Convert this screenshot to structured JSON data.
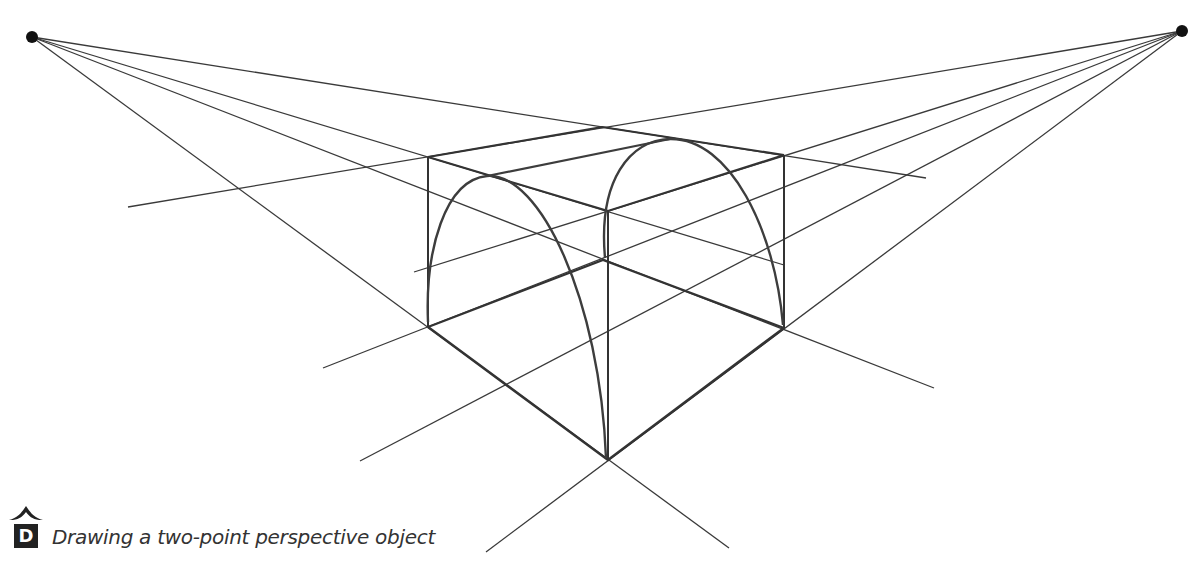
{
  "caption": {
    "badge_letter": "D",
    "text": "Drawing a two-point perspective object"
  },
  "colors": {
    "line": "#3a3a3a",
    "bold_line": "#333333",
    "vanishing_point": "#111111",
    "badge": "#222222",
    "caption_text": "#333333"
  },
  "diagram": {
    "type": "two-point-perspective",
    "vanishing_points": [
      {
        "name": "left",
        "x": 32,
        "y": 37
      },
      {
        "name": "right",
        "x": 1182,
        "y": 31
      }
    ],
    "box_corners": {
      "top_back": [
        602,
        127
      ],
      "top_left": [
        428,
        157
      ],
      "top_right": [
        784,
        155
      ],
      "top_front": [
        608,
        211
      ],
      "bottom_back": [
        603,
        260
      ],
      "bottom_left": [
        428,
        327
      ],
      "bottom_right": [
        784,
        328
      ],
      "bottom_front": [
        608,
        460
      ]
    },
    "arches": [
      "left-face-arch",
      "right-face-arch"
    ]
  }
}
